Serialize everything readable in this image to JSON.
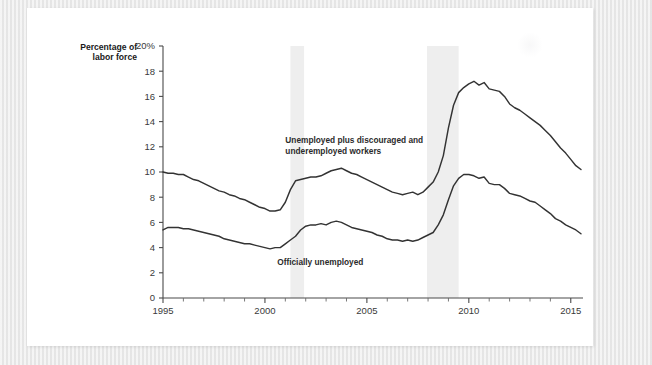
{
  "chart_data": {
    "type": "line",
    "title": "",
    "xlabel": "",
    "ylabel": "Percentage of labor force",
    "ylabel_line1": "Percentage of",
    "ylabel_line2": "labor force",
    "xlim": [
      1995,
      2015.6
    ],
    "ylim": [
      0,
      20
    ],
    "yticks": [
      0,
      2,
      4,
      6,
      8,
      10,
      12,
      14,
      16,
      18,
      20
    ],
    "ytick_labels": [
      "0",
      "2",
      "4",
      "6",
      "8",
      "10",
      "12",
      "14",
      "16",
      "18",
      "20%"
    ],
    "xticks": [
      1995,
      1996,
      1997,
      1998,
      1999,
      2000,
      2001,
      2002,
      2003,
      2004,
      2005,
      2006,
      2007,
      2008,
      2009,
      2010,
      2011,
      2012,
      2013,
      2014,
      2015
    ],
    "xtick_labels_shown": [
      "1995",
      "2000",
      "2005",
      "2010",
      "2015"
    ],
    "xtick_label_years": [
      1995,
      2000,
      2005,
      2010,
      2015
    ],
    "grid": false,
    "legend_position": "inline-annotations",
    "annotations": [
      {
        "name": "upper-series-label",
        "text_line1": "Unemployed plus discouraged and",
        "text_line2": "underemployed workers",
        "x": 2001.0,
        "y": 12.3
      },
      {
        "name": "lower-series-label",
        "text": "Officially unemployed",
        "x": 2000.6,
        "y": 2.6
      }
    ],
    "shaded_regions": [
      {
        "name": "recession-2001",
        "x0": 2001.25,
        "x1": 2001.92,
        "color": "#eeeeee"
      },
      {
        "name": "recession-2008",
        "x0": 2007.95,
        "x1": 2009.5,
        "color": "#eeeeee"
      }
    ],
    "series": [
      {
        "name": "Unemployed plus discouraged and underemployed workers",
        "color": "#333333",
        "x": [
          1995.0,
          1995.25,
          1995.5,
          1995.75,
          1996.0,
          1996.25,
          1996.5,
          1996.75,
          1997.0,
          1997.25,
          1997.5,
          1997.75,
          1998.0,
          1998.25,
          1998.5,
          1998.75,
          1999.0,
          1999.25,
          1999.5,
          1999.75,
          2000.0,
          2000.25,
          2000.5,
          2000.75,
          2001.0,
          2001.25,
          2001.5,
          2001.75,
          2002.0,
          2002.25,
          2002.5,
          2002.75,
          2003.0,
          2003.25,
          2003.5,
          2003.75,
          2004.0,
          2004.25,
          2004.5,
          2004.75,
          2005.0,
          2005.25,
          2005.5,
          2005.75,
          2006.0,
          2006.25,
          2006.5,
          2006.75,
          2007.0,
          2007.25,
          2007.5,
          2007.75,
          2008.0,
          2008.25,
          2008.5,
          2008.75,
          2009.0,
          2009.25,
          2009.5,
          2009.75,
          2010.0,
          2010.25,
          2010.5,
          2010.75,
          2011.0,
          2011.25,
          2011.5,
          2011.75,
          2012.0,
          2012.25,
          2012.5,
          2012.75,
          2013.0,
          2013.25,
          2013.5,
          2013.75,
          2014.0,
          2014.25,
          2014.5,
          2014.75,
          2015.0,
          2015.25,
          2015.5
        ],
        "y": [
          10.0,
          9.9,
          9.9,
          9.8,
          9.8,
          9.6,
          9.4,
          9.3,
          9.1,
          8.9,
          8.7,
          8.5,
          8.4,
          8.2,
          8.1,
          7.9,
          7.8,
          7.6,
          7.4,
          7.2,
          7.1,
          6.9,
          6.9,
          7.0,
          7.6,
          8.6,
          9.3,
          9.4,
          9.5,
          9.6,
          9.6,
          9.7,
          9.9,
          10.1,
          10.2,
          10.3,
          10.1,
          9.9,
          9.8,
          9.6,
          9.4,
          9.2,
          9.0,
          8.8,
          8.6,
          8.4,
          8.3,
          8.2,
          8.3,
          8.4,
          8.2,
          8.4,
          8.8,
          9.2,
          10.0,
          11.3,
          13.5,
          15.3,
          16.3,
          16.7,
          17.0,
          17.2,
          16.9,
          17.1,
          16.6,
          16.5,
          16.4,
          16.0,
          15.4,
          15.1,
          14.9,
          14.6,
          14.3,
          14.0,
          13.7,
          13.3,
          12.9,
          12.4,
          11.9,
          11.5,
          11.0,
          10.5,
          10.2
        ]
      },
      {
        "name": "Officially unemployed",
        "color": "#333333",
        "x": [
          1995.0,
          1995.25,
          1995.5,
          1995.75,
          1996.0,
          1996.25,
          1996.5,
          1996.75,
          1997.0,
          1997.25,
          1997.5,
          1997.75,
          1998.0,
          1998.25,
          1998.5,
          1998.75,
          1999.0,
          1999.25,
          1999.5,
          1999.75,
          2000.0,
          2000.25,
          2000.5,
          2000.75,
          2001.0,
          2001.25,
          2001.5,
          2001.75,
          2002.0,
          2002.25,
          2002.5,
          2002.75,
          2003.0,
          2003.25,
          2003.5,
          2003.75,
          2004.0,
          2004.25,
          2004.5,
          2004.75,
          2005.0,
          2005.25,
          2005.5,
          2005.75,
          2006.0,
          2006.25,
          2006.5,
          2006.75,
          2007.0,
          2007.25,
          2007.5,
          2007.75,
          2008.0,
          2008.25,
          2008.5,
          2008.75,
          2009.0,
          2009.25,
          2009.5,
          2009.75,
          2010.0,
          2010.25,
          2010.5,
          2010.75,
          2011.0,
          2011.25,
          2011.5,
          2011.75,
          2012.0,
          2012.25,
          2012.5,
          2012.75,
          2013.0,
          2013.25,
          2013.5,
          2013.75,
          2014.0,
          2014.25,
          2014.5,
          2014.75,
          2015.0,
          2015.25,
          2015.5
        ],
        "y": [
          5.4,
          5.6,
          5.6,
          5.6,
          5.5,
          5.5,
          5.4,
          5.3,
          5.2,
          5.1,
          5.0,
          4.9,
          4.7,
          4.6,
          4.5,
          4.4,
          4.3,
          4.3,
          4.2,
          4.1,
          4.0,
          3.9,
          4.0,
          4.0,
          4.3,
          4.6,
          4.9,
          5.4,
          5.7,
          5.8,
          5.8,
          5.9,
          5.8,
          6.0,
          6.1,
          6.0,
          5.8,
          5.6,
          5.5,
          5.4,
          5.3,
          5.2,
          5.0,
          4.9,
          4.7,
          4.6,
          4.6,
          4.5,
          4.6,
          4.5,
          4.6,
          4.8,
          5.0,
          5.2,
          5.8,
          6.6,
          7.8,
          8.9,
          9.5,
          9.8,
          9.8,
          9.7,
          9.5,
          9.6,
          9.1,
          9.0,
          9.0,
          8.7,
          8.3,
          8.2,
          8.1,
          7.9,
          7.7,
          7.6,
          7.3,
          7.0,
          6.7,
          6.3,
          6.1,
          5.8,
          5.6,
          5.4,
          5.1
        ]
      }
    ]
  }
}
